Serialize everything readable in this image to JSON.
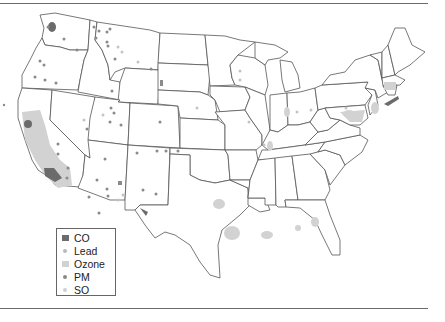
{
  "figure": {
    "type": "choropleth-point-map",
    "region": "Contiguous United States"
  },
  "legend": {
    "items": [
      {
        "label": "CO",
        "symbol": "square",
        "color": "#6b6b6b"
      },
      {
        "label": "Lead",
        "symbol": "dot",
        "color": "#b9b9b9"
      },
      {
        "label": "Ozone",
        "symbol": "square",
        "color": "#d2d2d2"
      },
      {
        "label": "PM",
        "symbol": "dot",
        "color": "#8a8a8a"
      },
      {
        "label": "SO",
        "symbol": "dot",
        "color": "#cfcfcf"
      }
    ]
  },
  "colors": {
    "co": "#6b6b6b",
    "ozone": "#d2d2d2",
    "pm": "#8a8a8a",
    "lead": "#b9b9b9",
    "so": "#cfcfcf",
    "border": "#555555"
  },
  "markers": {
    "co_areas": [
      {
        "x": 27,
        "y": 124
      },
      {
        "x": 52,
        "y": 172
      },
      {
        "x": 143,
        "y": 210
      },
      {
        "x": 393,
        "y": 101
      },
      {
        "x": 52,
        "y": 27
      }
    ],
    "ozone_areas": [
      {
        "x": 42,
        "y": 148
      },
      {
        "x": 55,
        "y": 175
      },
      {
        "x": 219,
        "y": 204
      },
      {
        "x": 232,
        "y": 233
      },
      {
        "x": 267,
        "y": 234
      },
      {
        "x": 315,
        "y": 221
      },
      {
        "x": 298,
        "y": 228
      },
      {
        "x": 388,
        "y": 86
      },
      {
        "x": 375,
        "y": 112
      },
      {
        "x": 349,
        "y": 112
      },
      {
        "x": 389,
        "y": 100
      },
      {
        "x": 287,
        "y": 112
      },
      {
        "x": 269,
        "y": 145
      }
    ],
    "pm_points": [
      {
        "x": 48,
        "y": 27
      },
      {
        "x": 64,
        "y": 39
      },
      {
        "x": 77,
        "y": 50
      },
      {
        "x": 94,
        "y": 27
      },
      {
        "x": 99,
        "y": 31
      },
      {
        "x": 107,
        "y": 32
      },
      {
        "x": 110,
        "y": 29
      },
      {
        "x": 96,
        "y": 38
      },
      {
        "x": 107,
        "y": 42
      },
      {
        "x": 108,
        "y": 46
      },
      {
        "x": 115,
        "y": 59
      },
      {
        "x": 40,
        "y": 61
      },
      {
        "x": 44,
        "y": 65
      },
      {
        "x": 35,
        "y": 77
      },
      {
        "x": 45,
        "y": 80
      },
      {
        "x": 56,
        "y": 83
      },
      {
        "x": 112,
        "y": 91
      },
      {
        "x": 151,
        "y": 69
      },
      {
        "x": 111,
        "y": 108
      },
      {
        "x": 114,
        "y": 113
      },
      {
        "x": 110,
        "y": 122
      },
      {
        "x": 87,
        "y": 129
      },
      {
        "x": 121,
        "y": 125
      },
      {
        "x": 160,
        "y": 122
      },
      {
        "x": 157,
        "y": 151
      },
      {
        "x": 58,
        "y": 144
      },
      {
        "x": 58,
        "y": 154
      },
      {
        "x": 105,
        "y": 159
      },
      {
        "x": 137,
        "y": 153
      },
      {
        "x": 97,
        "y": 180
      },
      {
        "x": 107,
        "y": 189
      },
      {
        "x": 108,
        "y": 196
      },
      {
        "x": 89,
        "y": 197
      },
      {
        "x": 68,
        "y": 168
      },
      {
        "x": 67,
        "y": 178
      },
      {
        "x": 166,
        "y": 151
      },
      {
        "x": 178,
        "y": 151
      },
      {
        "x": 143,
        "y": 190
      },
      {
        "x": 99,
        "y": 213
      },
      {
        "x": 156,
        "y": 194
      },
      {
        "x": 4,
        "y": 105
      }
    ],
    "lead_points": [
      {
        "x": 118,
        "y": 47
      },
      {
        "x": 122,
        "y": 52
      },
      {
        "x": 138,
        "y": 62
      },
      {
        "x": 103,
        "y": 115
      },
      {
        "x": 84,
        "y": 120
      },
      {
        "x": 123,
        "y": 195
      },
      {
        "x": 118,
        "y": 200
      },
      {
        "x": 197,
        "y": 108
      },
      {
        "x": 240,
        "y": 71
      },
      {
        "x": 240,
        "y": 80
      },
      {
        "x": 249,
        "y": 122
      },
      {
        "x": 264,
        "y": 145
      },
      {
        "x": 311,
        "y": 110
      },
      {
        "x": 297,
        "y": 112
      },
      {
        "x": 349,
        "y": 114
      },
      {
        "x": 346,
        "y": 108
      }
    ]
  }
}
